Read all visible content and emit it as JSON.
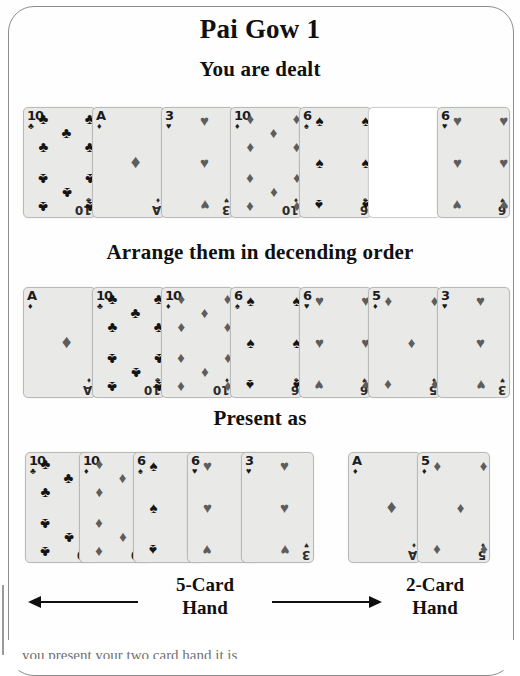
{
  "title": "Pai Gow 1",
  "sections": {
    "dealt_label": "You are dealt",
    "arrange_label": "Arrange them in decending order",
    "present_label": "Present as"
  },
  "hands": {
    "five_card_label": "5-Card\nHand",
    "five_card_line1": "5-Card",
    "five_card_line2": "Hand",
    "two_card_line1": "2-Card",
    "two_card_line2": "Hand"
  },
  "colors": {
    "card_face": "#e9e9e7",
    "card_border": "#b9b9b7",
    "pip_black": "#141414",
    "pip_gray": "#5d5d5d",
    "text": "#101010",
    "frame": "#8d8d8d"
  },
  "card_rows": {
    "dealt": {
      "name": "dealt-row",
      "cards": [
        {
          "rank": "10",
          "suit": "clubs",
          "suit_glyph": "♣",
          "shade": "black",
          "count": 10,
          "blank": false
        },
        {
          "rank": "A",
          "suit": "diamonds",
          "suit_glyph": "♦",
          "shade": "gray",
          "count": 1,
          "blank": false
        },
        {
          "rank": "3",
          "suit": "hearts",
          "suit_glyph": "♥",
          "shade": "gray",
          "count": 3,
          "blank": false
        },
        {
          "rank": "10",
          "suit": "diamonds",
          "suit_glyph": "♦",
          "shade": "gray",
          "count": 10,
          "blank": false
        },
        {
          "rank": "6",
          "suit": "spades",
          "suit_glyph": "♠",
          "shade": "black",
          "count": 6,
          "blank": false
        },
        {
          "rank": "",
          "suit": "blank",
          "suit_glyph": "",
          "shade": "gray",
          "count": 0,
          "blank": true
        },
        {
          "rank": "6",
          "suit": "hearts",
          "suit_glyph": "♥",
          "shade": "gray",
          "count": 6,
          "blank": false
        }
      ]
    },
    "sorted": {
      "name": "sorted-row",
      "cards": [
        {
          "rank": "A",
          "suit": "diamonds",
          "suit_glyph": "♦",
          "shade": "gray",
          "count": 1,
          "blank": false
        },
        {
          "rank": "10",
          "suit": "clubs",
          "suit_glyph": "♣",
          "shade": "black",
          "count": 10,
          "blank": false
        },
        {
          "rank": "10",
          "suit": "diamonds",
          "suit_glyph": "♦",
          "shade": "gray",
          "count": 10,
          "blank": false
        },
        {
          "rank": "6",
          "suit": "spades",
          "suit_glyph": "♠",
          "shade": "black",
          "count": 6,
          "blank": false
        },
        {
          "rank": "6",
          "suit": "hearts",
          "suit_glyph": "♥",
          "shade": "gray",
          "count": 6,
          "blank": false
        },
        {
          "rank": "5",
          "suit": "diamonds",
          "suit_glyph": "♦",
          "shade": "gray",
          "count": 5,
          "blank": false
        },
        {
          "rank": "3",
          "suit": "hearts",
          "suit_glyph": "♥",
          "shade": "gray",
          "count": 3,
          "blank": false
        }
      ]
    },
    "five_card_hand": {
      "name": "five-card-hand",
      "cards": [
        {
          "rank": "10",
          "suit": "clubs",
          "suit_glyph": "♣",
          "shade": "black",
          "count": 10,
          "blank": false
        },
        {
          "rank": "10",
          "suit": "diamonds",
          "suit_glyph": "♦",
          "shade": "gray",
          "count": 10,
          "blank": false
        },
        {
          "rank": "6",
          "suit": "spades",
          "suit_glyph": "♠",
          "shade": "black",
          "count": 6,
          "blank": false
        },
        {
          "rank": "6",
          "suit": "hearts",
          "suit_glyph": "♥",
          "shade": "gray",
          "count": 6,
          "blank": false
        },
        {
          "rank": "3",
          "suit": "hearts",
          "suit_glyph": "♥",
          "shade": "gray",
          "count": 3,
          "blank": false
        }
      ]
    },
    "two_card_hand": {
      "name": "two-card-hand",
      "cards": [
        {
          "rank": "A",
          "suit": "diamonds",
          "suit_glyph": "♦",
          "shade": "gray",
          "count": 1,
          "blank": false
        },
        {
          "rank": "5",
          "suit": "diamonds",
          "suit_glyph": "♦",
          "shade": "gray",
          "count": 5,
          "blank": false
        }
      ]
    }
  },
  "layout": {
    "dealt_spacing": 69,
    "sorted_spacing": 69,
    "five_spacing": 54,
    "two_spacing": 69
  },
  "cut_off_text": "you present your two card hand it is"
}
